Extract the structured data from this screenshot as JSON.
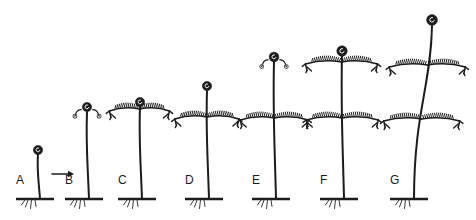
{
  "figure": {
    "type": "botanical-growth-sequence",
    "background_color": "#ffffff",
    "ink_color": "#1c1c1c",
    "width": 476,
    "height": 220
  },
  "arrow": {
    "name": "progression-arrow",
    "direction": "right",
    "x": 52,
    "y": 174,
    "length": 22
  },
  "stages": [
    {
      "label": "A",
      "label_x": 16,
      "label_y": 184,
      "ground_x": 16,
      "ground_y": 199,
      "ground_width": 38,
      "stem_base_x": 40,
      "stem_top_x": 38,
      "stem_top_y": 154,
      "crozier": {
        "x": 38,
        "y": 150,
        "r": 4.6,
        "curls": 0
      },
      "whorls": []
    },
    {
      "label": "B",
      "label_x": 65,
      "label_y": 184,
      "ground_x": 65,
      "ground_y": 199,
      "ground_width": 38,
      "stem_base_x": 89,
      "stem_top_x": 87,
      "stem_top_y": 112,
      "crozier": {
        "x": 87,
        "y": 107,
        "r": 4.6,
        "curls": 2
      },
      "whorls": []
    },
    {
      "label": "C",
      "label_x": 118,
      "label_y": 184,
      "ground_x": 118,
      "ground_y": 199,
      "ground_width": 38,
      "stem_base_x": 142,
      "stem_top_x": 140,
      "stem_top_y": 107,
      "crozier": {
        "x": 140,
        "y": 102,
        "r": 4.6,
        "curls": 0
      },
      "whorls": [
        {
          "y": 109,
          "span": 30
        }
      ]
    },
    {
      "label": "D",
      "label_x": 185,
      "label_y": 184,
      "ground_x": 185,
      "ground_y": 199,
      "ground_width": 38,
      "stem_base_x": 209,
      "stem_top_x": 207,
      "stem_top_y": 91,
      "crozier": {
        "x": 207,
        "y": 86,
        "r": 4.6,
        "curls": 0
      },
      "whorls": [
        {
          "y": 117,
          "span": 32
        }
      ]
    },
    {
      "label": "E",
      "label_x": 252,
      "label_y": 184,
      "ground_x": 252,
      "ground_y": 199,
      "ground_width": 38,
      "stem_base_x": 276,
      "stem_top_x": 274,
      "stem_top_y": 62,
      "crozier": {
        "x": 274,
        "y": 57,
        "r": 4.8,
        "curls": 2
      },
      "whorls": [
        {
          "y": 118,
          "span": 34
        }
      ]
    },
    {
      "label": "F",
      "label_x": 320,
      "label_y": 184,
      "ground_x": 320,
      "ground_y": 199,
      "ground_width": 38,
      "stem_base_x": 344,
      "stem_top_x": 342,
      "stem_top_y": 56,
      "crozier": {
        "x": 342,
        "y": 51,
        "r": 5.2,
        "curls": 0
      },
      "whorls": [
        {
          "y": 62,
          "span": 36
        },
        {
          "y": 118,
          "span": 36
        }
      ]
    },
    {
      "label": "G",
      "label_x": 390,
      "label_y": 184,
      "ground_x": 390,
      "ground_y": 199,
      "ground_width": 38,
      "stem_base_x": 414,
      "stem_top_x": 432,
      "stem_top_y": 26,
      "crozier": {
        "x": 432,
        "y": 20,
        "r": 5.4,
        "curls": 0
      },
      "whorls": [
        {
          "y": 65,
          "span": 38
        },
        {
          "y": 119,
          "span": 38
        }
      ]
    }
  ]
}
